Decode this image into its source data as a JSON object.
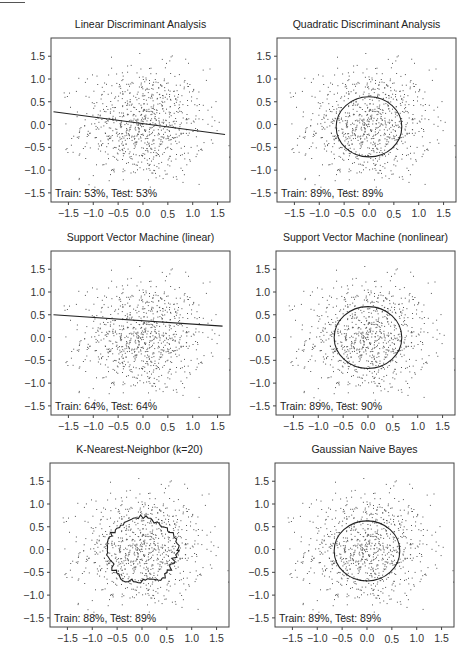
{
  "figure": {
    "layout": {
      "rows": 3,
      "cols": 2
    },
    "axis_ticks": {
      "x": [
        "−1.5",
        "−1.0",
        "−0.5",
        "0.0",
        "0.5",
        "1.0",
        "1.5"
      ],
      "y": [
        "1.5",
        "1.0",
        "0.5",
        "0.0",
        "−0.5",
        "−1.0",
        "−1.5"
      ]
    },
    "colors": {
      "points": "#555555",
      "boundary": "#222222",
      "frame": "#444444"
    }
  },
  "chart_data": [
    {
      "type": "scatter",
      "title": "Linear Discriminant Analysis",
      "annotation": "Train: 53%, Test: 53%",
      "xlim": [
        -1.85,
        1.75
      ],
      "ylim": [
        -1.7,
        1.9
      ],
      "xticks": [
        -1.5,
        -1.0,
        -0.5,
        0.0,
        0.5,
        1.0,
        1.5
      ],
      "yticks": [
        -1.5,
        -1.0,
        -0.5,
        0.0,
        0.5,
        1.0,
        1.5
      ],
      "grid": false,
      "boundary": {
        "kind": "line",
        "points": [
          [
            -1.8,
            0.28
          ],
          [
            1.65,
            -0.22
          ]
        ]
      },
      "train_accuracy": 53,
      "test_accuracy": 53
    },
    {
      "type": "scatter",
      "title": "Quadratic Discriminant Analysis",
      "annotation": "Train: 89%, Test: 89%",
      "xlim": [
        -1.85,
        1.75
      ],
      "ylim": [
        -1.7,
        1.9
      ],
      "xticks": [
        -1.5,
        -1.0,
        -0.5,
        0.0,
        0.5,
        1.0,
        1.5
      ],
      "yticks": [
        -1.5,
        -1.0,
        -0.5,
        0.0,
        0.5,
        1.0,
        1.5
      ],
      "grid": false,
      "boundary": {
        "kind": "circle",
        "cx": 0.0,
        "cy": -0.05,
        "r": 0.66
      },
      "train_accuracy": 89,
      "test_accuracy": 89
    },
    {
      "type": "scatter",
      "title": "Support Vector Machine (linear)",
      "annotation": "Train: 64%, Test: 64%",
      "xlim": [
        -1.85,
        1.75
      ],
      "ylim": [
        -1.7,
        1.9
      ],
      "xticks": [
        -1.5,
        -1.0,
        -0.5,
        0.0,
        0.5,
        1.0,
        1.5
      ],
      "yticks": [
        -1.5,
        -1.0,
        -0.5,
        0.0,
        0.5,
        1.0,
        1.5
      ],
      "grid": false,
      "boundary": {
        "kind": "line",
        "points": [
          [
            -1.8,
            0.5
          ],
          [
            1.6,
            0.25
          ]
        ]
      },
      "train_accuracy": 64,
      "test_accuracy": 64
    },
    {
      "type": "scatter",
      "title": "Support Vector Machine (nonlinear)",
      "annotation": "Train: 89%, Test: 90%",
      "xlim": [
        -1.85,
        1.75
      ],
      "ylim": [
        -1.7,
        1.9
      ],
      "xticks": [
        -1.5,
        -1.0,
        -0.5,
        0.0,
        0.5,
        1.0,
        1.5
      ],
      "yticks": [
        -1.5,
        -1.0,
        -0.5,
        0.0,
        0.5,
        1.0,
        1.5
      ],
      "grid": false,
      "boundary": {
        "kind": "circle",
        "cx": 0.0,
        "cy": 0.0,
        "r": 0.68
      },
      "train_accuracy": 89,
      "test_accuracy": 90
    },
    {
      "type": "scatter",
      "title": "K-Nearest-Neighbor (k=20)",
      "annotation": "Train: 88%, Test: 89%",
      "xlim": [
        -1.85,
        1.75
      ],
      "ylim": [
        -1.7,
        1.9
      ],
      "xticks": [
        -1.5,
        -1.0,
        -0.5,
        0.0,
        0.5,
        1.0,
        1.5
      ],
      "yticks": [
        -1.5,
        -1.0,
        -0.5,
        0.0,
        0.5,
        1.0,
        1.5
      ],
      "grid": false,
      "boundary": {
        "kind": "jagged",
        "cx": 0.0,
        "cy": -0.02,
        "r": 0.7
      },
      "train_accuracy": 88,
      "test_accuracy": 89
    },
    {
      "type": "scatter",
      "title": "Gaussian Naive Bayes",
      "annotation": "Train: 89%, Test: 89%",
      "xlim": [
        -1.85,
        1.75
      ],
      "ylim": [
        -1.7,
        1.9
      ],
      "xticks": [
        -1.5,
        -1.0,
        -0.5,
        0.0,
        0.5,
        1.0,
        1.5
      ],
      "yticks": [
        -1.5,
        -1.0,
        -0.5,
        0.0,
        0.5,
        1.0,
        1.5
      ],
      "grid": false,
      "boundary": {
        "kind": "circle",
        "cx": 0.0,
        "cy": -0.03,
        "r": 0.66
      },
      "train_accuracy": 89,
      "test_accuracy": 89
    }
  ]
}
